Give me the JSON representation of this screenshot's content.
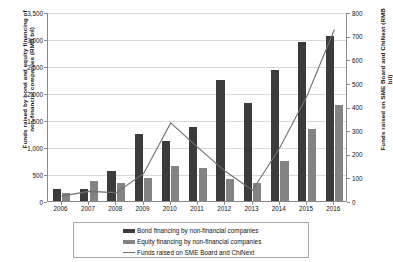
{
  "chart_data": {
    "type": "bar",
    "title": "",
    "subtitle": "",
    "xlabel": "",
    "categories": [
      "2006",
      "2007",
      "2008",
      "2009",
      "2010",
      "2011",
      "2012",
      "2013",
      "2014",
      "2015",
      "2016"
    ],
    "axes": {
      "left": {
        "label": "Funds raised by bond and equity financing of non-financial companies (RMB bil)",
        "ylim": [
          0,
          3500
        ],
        "ticks": [
          0,
          500,
          1000,
          1500,
          2000,
          2500,
          3000,
          3500
        ],
        "tick_labels": [
          "0",
          "500",
          "1,000",
          "1,500",
          "2,000",
          "2,500",
          "3,000",
          "3,500"
        ]
      },
      "right": {
        "label": "Funds raised on SME Board and ChiNext (RMB bil)",
        "ylim": [
          0,
          800
        ],
        "ticks": [
          0,
          100,
          200,
          300,
          400,
          500,
          600,
          700,
          800
        ],
        "tick_labels": [
          "0",
          "100",
          "200",
          "300",
          "400",
          "500",
          "600",
          "700",
          "800"
        ]
      }
    },
    "grid": true,
    "legend_position": "bottom",
    "series": [
      {
        "name": "Bond financing by non-financial companies",
        "type": "bar",
        "axis": "left",
        "color": "#3b3b3b",
        "values": [
          230,
          230,
          550,
          1240,
          1110,
          1380,
          2250,
          1820,
          2430,
          2940,
          3050
        ]
      },
      {
        "name": "Equity financing by non-financial companies",
        "type": "bar",
        "axis": "left",
        "color": "#838383",
        "values": [
          150,
          370,
          330,
          420,
          650,
          620,
          400,
          330,
          740,
          1330,
          1780
        ]
      },
      {
        "name": "Funds raised on SME Board and ChiNext",
        "type": "line",
        "axis": "right",
        "color": "#6f6f6f",
        "values": [
          25,
          45,
          40,
          120,
          335,
          230,
          130,
          50,
          230,
          450,
          730
        ]
      }
    ]
  },
  "legend": {
    "items": [
      {
        "label": "Bond financing by non-financial companies",
        "marker": "bar-dark"
      },
      {
        "label": "Equity financing by non-financial companies",
        "marker": "bar-gray"
      },
      {
        "label": "Funds raised on SME Board and ChiNext",
        "marker": "line"
      }
    ]
  }
}
